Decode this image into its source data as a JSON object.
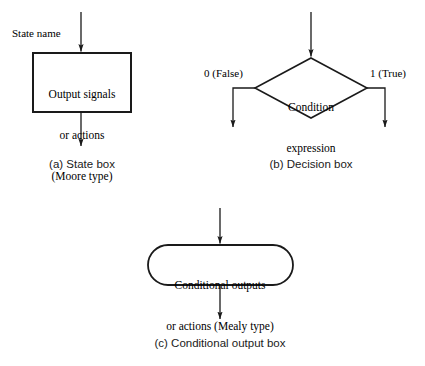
{
  "figure": {
    "stroke_color": "#1a1a1a",
    "fill_color": "#ffffff",
    "background": "#ffffff"
  },
  "state_box": {
    "input_label": "State name",
    "line1": "Output signals",
    "line2": "or actions",
    "line3": "(Moore type)",
    "caption": "(a) State box"
  },
  "decision_box": {
    "line1": "Condition",
    "line2": "expression",
    "false_label": "0 (False)",
    "true_label": "1 (True)",
    "caption": "(b) Decision box"
  },
  "conditional_output_box": {
    "line1": "Conditional outputs",
    "line2": "or actions (Mealy type)",
    "caption": "(c) Conditional output box"
  }
}
